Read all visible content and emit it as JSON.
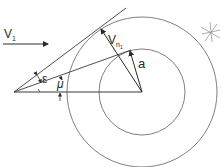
{
  "diagram": {
    "type": "geometry",
    "colors": {
      "line": "#3a3a3a",
      "circle": "#6a6a6a",
      "background": "#ffffff"
    },
    "labels": {
      "v1": "V",
      "v1_sub": "1",
      "vn1": "V",
      "vn1_sub": "n",
      "vn1_subsub": "1",
      "a": "a",
      "epsilon": "ε",
      "mu": "μ"
    },
    "geometry": {
      "origin": [
        14,
        92
      ],
      "center": [
        142,
        92
      ],
      "outer_radius": 75,
      "inner_radius": 43
    }
  }
}
